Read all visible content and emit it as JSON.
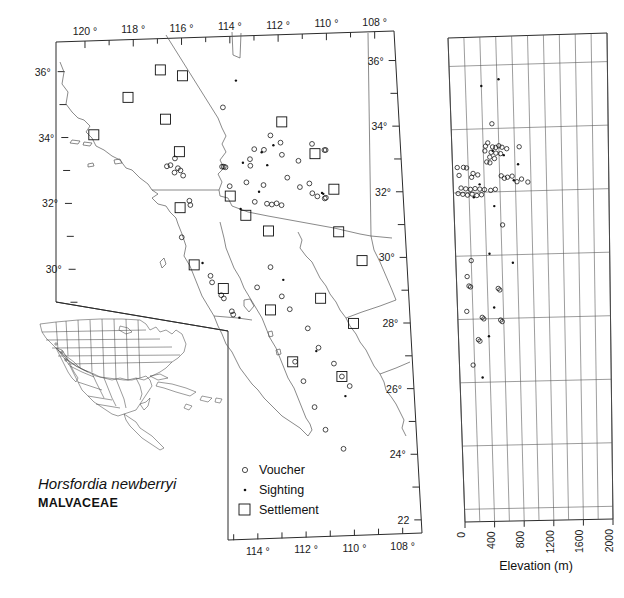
{
  "species": {
    "name": "Horsfordia newberryi",
    "family": "MALVACEAE"
  },
  "legend": {
    "items": [
      {
        "symbol": "circle",
        "label": "Voucher"
      },
      {
        "symbol": "dot",
        "label": "Sighting"
      },
      {
        "symbol": "square",
        "label": "Settlement"
      }
    ]
  },
  "map": {
    "longitude_top_labels": [
      "120 °",
      "118 °",
      "116 °",
      "114 °",
      "112 °",
      "110 °",
      "108 °"
    ],
    "longitude_bottom_labels": [
      "114 °",
      "112 °",
      "110 °",
      "108 °"
    ],
    "longitude_top_values": [
      120,
      118,
      116,
      114,
      112,
      110,
      108
    ],
    "longitude_bottom_values": [
      114,
      112,
      110,
      108
    ],
    "latitude_left_labels": [
      "36°",
      "34°",
      "32°",
      "30°"
    ],
    "latitude_left_values": [
      36,
      34,
      32,
      30
    ],
    "latitude_right_labels": [
      "36°",
      "34°",
      "32°",
      "30°",
      "28°",
      "26°",
      "24°",
      "22"
    ],
    "latitude_right_values": [
      36,
      34,
      32,
      30,
      28,
      26,
      24,
      22
    ],
    "lon_range": [
      121.2,
      107.2
    ],
    "lat_range": [
      21.6,
      36.9
    ]
  },
  "elevation_panel": {
    "title": "Elevation (m)",
    "x_tick_labels": [
      "0",
      "400",
      "800",
      "1200",
      "1600",
      "2000"
    ],
    "x_tick_values": [
      0,
      400,
      800,
      1200,
      1600,
      2000
    ],
    "x_minor_step": 200,
    "xlim": [
      0,
      2000
    ],
    "ylim": [
      21.6,
      36.9
    ],
    "y_gridline_values": [
      22,
      24,
      26,
      28,
      30,
      32,
      34,
      36
    ]
  },
  "chart_data": {
    "type": "scatter",
    "xlabel": "Elevation (m)",
    "ylabel": "Latitude (°N)",
    "map_points": {
      "voucher": [
        [
          114.45,
          34.75
        ],
        [
          112.55,
          33.85
        ],
        [
          113.25,
          33.45
        ],
        [
          112.85,
          33.42
        ],
        [
          113.45,
          33.15
        ],
        [
          113.45,
          32.95
        ],
        [
          112.15,
          33.62
        ],
        [
          112.12,
          33.25
        ],
        [
          110.85,
          33.55
        ],
        [
          110.35,
          33.35
        ],
        [
          110.3,
          33.35
        ],
        [
          111.45,
          33.05
        ],
        [
          116.55,
          33.25
        ],
        [
          116.75,
          33.05
        ],
        [
          116.9,
          33.02
        ],
        [
          116.45,
          32.95
        ],
        [
          116.35,
          32.88
        ],
        [
          116.6,
          32.82
        ],
        [
          116.25,
          32.72
        ],
        [
          114.62,
          32.95
        ],
        [
          114.55,
          32.95
        ],
        [
          114.48,
          32.93
        ],
        [
          114.35,
          32.35
        ],
        [
          113.65,
          32.45
        ],
        [
          112.95,
          32.35
        ],
        [
          111.95,
          32.55
        ],
        [
          111.45,
          32.25
        ],
        [
          111.05,
          32.35
        ],
        [
          110.95,
          32.05
        ],
        [
          110.75,
          31.95
        ],
        [
          110.45,
          31.88
        ],
        [
          110.4,
          31.9
        ],
        [
          113.35,
          31.85
        ],
        [
          112.85,
          31.78
        ],
        [
          112.65,
          31.75
        ],
        [
          112.45,
          31.78
        ],
        [
          112.25,
          31.72
        ],
        [
          116.05,
          31.95
        ],
        [
          116.02,
          31.82
        ],
        [
          116.45,
          30.85
        ],
        [
          115.35,
          29.65
        ],
        [
          115.3,
          29.45
        ],
        [
          114.95,
          29.05
        ],
        [
          114.85,
          28.95
        ],
        [
          114.55,
          28.55
        ],
        [
          114.5,
          28.45
        ],
        [
          113.45,
          29.25
        ],
        [
          112.85,
          29.85
        ],
        [
          112.45,
          28.95
        ],
        [
          112.15,
          28.55
        ],
        [
          111.45,
          27.95
        ],
        [
          111.05,
          27.35
        ],
        [
          110.45,
          26.85
        ],
        [
          110.15,
          26.45
        ],
        [
          109.85,
          26.15
        ],
        [
          112.05,
          26.95
        ],
        [
          111.75,
          26.35
        ],
        [
          111.35,
          25.55
        ],
        [
          110.95,
          24.85
        ],
        [
          110.25,
          24.25
        ]
      ],
      "sighting": [
        [
          113.85,
          35.55
        ],
        [
          112.95,
          33.35
        ],
        [
          113.75,
          33.05
        ],
        [
          112.45,
          33.55
        ],
        [
          112.75,
          32.95
        ],
        [
          110.55,
          32.05
        ],
        [
          110.5,
          32.02
        ],
        [
          113.95,
          31.65
        ],
        [
          115.65,
          30.05
        ],
        [
          114.25,
          28.35
        ],
        [
          112.35,
          29.45
        ],
        [
          111.15,
          27.25
        ],
        [
          110.05,
          25.85
        ],
        [
          113.15,
          32.15
        ]
      ],
      "settlement": [
        [
          116.95,
          35.95
        ],
        [
          116.05,
          35.75
        ],
        [
          118.35,
          35.15
        ],
        [
          116.85,
          34.45
        ],
        [
          112.05,
          34.25
        ],
        [
          110.75,
          33.25
        ],
        [
          116.35,
          33.45
        ],
        [
          119.85,
          34.05
        ],
        [
          110.05,
          32.15
        ],
        [
          116.45,
          31.75
        ],
        [
          113.75,
          31.45
        ],
        [
          112.85,
          30.95
        ],
        [
          109.95,
          30.85
        ],
        [
          109.05,
          29.95
        ],
        [
          116.0,
          30.0
        ],
        [
          114.85,
          29.25
        ],
        [
          112.95,
          28.55
        ],
        [
          110.85,
          28.85
        ],
        [
          109.55,
          28.05
        ],
        [
          112.15,
          26.95
        ],
        [
          110.15,
          26.45
        ],
        [
          114.35,
          32.05
        ]
      ]
    },
    "elevation_points": {
      "voucher": [
        [
          520,
          34.15
        ],
        [
          460,
          33.55
        ],
        [
          430,
          33.45
        ],
        [
          520,
          33.42
        ],
        [
          560,
          33.4
        ],
        [
          600,
          33.45
        ],
        [
          640,
          33.4
        ],
        [
          700,
          33.35
        ],
        [
          420,
          33.3
        ],
        [
          500,
          33.25
        ],
        [
          560,
          33.22
        ],
        [
          620,
          33.2
        ],
        [
          860,
          33.4
        ],
        [
          480,
          33.1
        ],
        [
          540,
          33.05
        ],
        [
          440,
          32.95
        ],
        [
          480,
          32.92
        ],
        [
          60,
          32.8
        ],
        [
          140,
          32.8
        ],
        [
          180,
          32.78
        ],
        [
          80,
          32.55
        ],
        [
          260,
          32.6
        ],
        [
          320,
          32.55
        ],
        [
          240,
          32.48
        ],
        [
          620,
          32.5
        ],
        [
          700,
          32.45
        ],
        [
          760,
          32.48
        ],
        [
          660,
          32.42
        ],
        [
          880,
          32.38
        ],
        [
          820,
          32.3
        ],
        [
          960,
          32.28
        ],
        [
          100,
          32.15
        ],
        [
          160,
          32.12
        ],
        [
          220,
          32.1
        ],
        [
          280,
          32.12
        ],
        [
          340,
          32.1
        ],
        [
          400,
          32.08
        ],
        [
          480,
          32.05
        ],
        [
          540,
          32.08
        ],
        [
          60,
          31.98
        ],
        [
          120,
          31.95
        ],
        [
          180,
          31.92
        ],
        [
          240,
          31.95
        ],
        [
          300,
          31.9
        ],
        [
          360,
          31.92
        ],
        [
          620,
          30.95
        ],
        [
          200,
          29.85
        ],
        [
          140,
          29.35
        ],
        [
          160,
          29.05
        ],
        [
          180,
          29.02
        ],
        [
          540,
          28.95
        ],
        [
          560,
          28.9
        ],
        [
          120,
          28.25
        ],
        [
          320,
          28.05
        ],
        [
          340,
          28.0
        ],
        [
          560,
          27.95
        ],
        [
          580,
          27.9
        ],
        [
          260,
          27.35
        ],
        [
          280,
          27.3
        ],
        [
          180,
          26.55
        ]
      ],
      "sighting": [
        [
          620,
          35.55
        ],
        [
          400,
          35.35
        ],
        [
          840,
          32.85
        ],
        [
          780,
          32.35
        ],
        [
          520,
          31.55
        ],
        [
          740,
          29.75
        ],
        [
          480,
          28.35
        ],
        [
          400,
          27.45
        ],
        [
          300,
          26.15
        ],
        [
          520,
          33.3
        ],
        [
          660,
          33.15
        ],
        [
          340,
          32.25
        ],
        [
          260,
          31.85
        ],
        [
          440,
          30.05
        ]
      ]
    },
    "legend_entries": [
      "Voucher",
      "Sighting",
      "Settlement"
    ],
    "legend_position": "bottom-center-left",
    "grid": true
  },
  "inset": {
    "region": "North America"
  }
}
